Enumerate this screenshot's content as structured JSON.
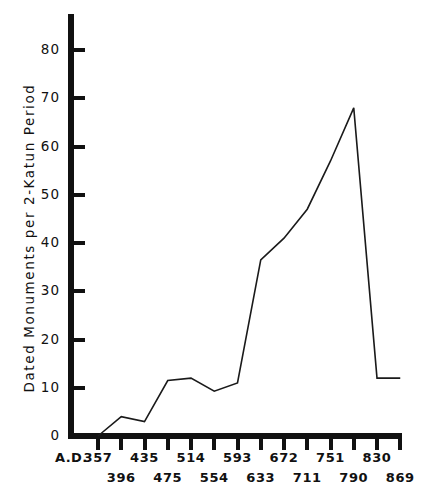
{
  "chart_data": {
    "type": "line",
    "title": "",
    "xlabel": "A.D.",
    "ylabel": "Dated Monuments per 2-Katun Period",
    "x_prefix": "A.D.",
    "categories": [
      "357",
      "396",
      "435",
      "475",
      "514",
      "554",
      "593",
      "633",
      "672",
      "711",
      "751",
      "790",
      "830",
      "869"
    ],
    "values": [
      0,
      4,
      3,
      11.5,
      12,
      9.3,
      11,
      36.5,
      41,
      47,
      57,
      68,
      12,
      12
    ],
    "series": [
      {
        "name": "Dated Monuments per 2-Katun Period",
        "values": [
          0,
          4,
          3,
          11.5,
          12,
          9.3,
          11,
          36.5,
          41,
          47,
          57,
          68,
          12,
          12
        ]
      }
    ],
    "ylim": [
      0,
      87
    ],
    "ytick_values": [
      0,
      10,
      20,
      30,
      40,
      50,
      60,
      70,
      80
    ],
    "ytick_labels": [
      "0",
      "10",
      "20",
      "30",
      "40",
      "50",
      "60",
      "70",
      "80"
    ],
    "xtick_labels_top": [
      "357",
      "435",
      "514",
      "593",
      "672",
      "751",
      "830"
    ],
    "xtick_labels_bottom": [
      "396",
      "475",
      "554",
      "633",
      "711",
      "790",
      "869"
    ],
    "grid": false,
    "legend": false,
    "line_color": "#1a1a1a",
    "axis_color": "#111111"
  }
}
